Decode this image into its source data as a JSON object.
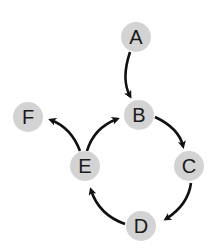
{
  "diagram": {
    "type": "directed-graph",
    "colors": {
      "node_fill": "#d3d3d3",
      "edge": "#111111",
      "label": "#1a1a1a"
    },
    "nodes": [
      {
        "id": "A",
        "label": "A",
        "x": 136,
        "y": 37
      },
      {
        "id": "B",
        "label": "B",
        "x": 139,
        "y": 115
      },
      {
        "id": "C",
        "label": "C",
        "x": 189,
        "y": 166
      },
      {
        "id": "D",
        "label": "D",
        "x": 141,
        "y": 226
      },
      {
        "id": "E",
        "label": "E",
        "x": 85,
        "y": 166
      },
      {
        "id": "F",
        "label": "F",
        "x": 28,
        "y": 117
      }
    ],
    "edges": [
      {
        "from": "A",
        "to": "B"
      },
      {
        "from": "B",
        "to": "C"
      },
      {
        "from": "C",
        "to": "D"
      },
      {
        "from": "D",
        "to": "E"
      },
      {
        "from": "E",
        "to": "B"
      },
      {
        "from": "E",
        "to": "F"
      }
    ]
  }
}
